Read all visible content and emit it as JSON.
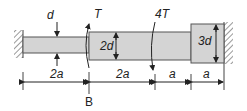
{
  "diagram": {
    "type": "stepped-shaft-torsion",
    "colors": {
      "shaft_fill": "#d4d4d4",
      "shaft_stroke": "#444444",
      "line": "#222222",
      "wall_hatch": "#555555",
      "background": "#ffffff"
    },
    "supports": {
      "left": "fixed wall",
      "right": "fixed wall"
    },
    "segments": [
      {
        "name": "thin",
        "diameter_label": "d",
        "length_label": "2a"
      },
      {
        "name": "medium",
        "diameter_label": "2d",
        "length_label": "2a"
      },
      {
        "name": "medium",
        "diameter_label": "2d",
        "length_label": "a"
      },
      {
        "name": "large",
        "diameter_label": "3d",
        "length_label": "a"
      }
    ],
    "loads": [
      {
        "label": "T",
        "position": "B (step between d and 2d)"
      },
      {
        "label": "4T",
        "position": "4a from left wall"
      }
    ],
    "labels": {
      "d": "d",
      "two_d": "2d",
      "three_d": "3d",
      "torque_T": "T",
      "torque_4T": "4T",
      "point_B": "B"
    },
    "dimensions": [
      "2a",
      "2a",
      "a",
      "a"
    ]
  }
}
